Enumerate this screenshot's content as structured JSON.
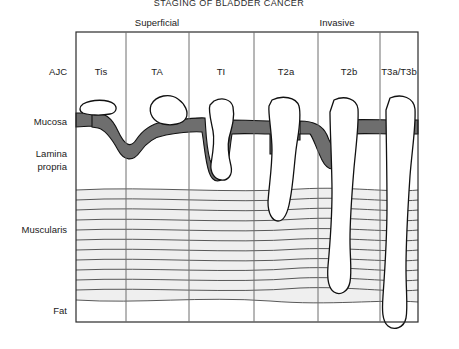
{
  "figure": {
    "title": "STAGING OF BLADDER CANCER",
    "group_labels": [
      {
        "name": "superficial",
        "text": "Superficial"
      },
      {
        "name": "invasive",
        "text": "Invasive"
      }
    ],
    "row_label_header": "AJC",
    "layer_labels": [
      {
        "name": "mucosa",
        "text": "Mucosa"
      },
      {
        "name": "lamina-propria",
        "text": "Lamina"
      },
      {
        "name": "lamina-propria-2",
        "text": "propria"
      },
      {
        "name": "muscularis",
        "text": "Muscularis"
      },
      {
        "name": "fat",
        "text": "Fat"
      }
    ],
    "stages": [
      {
        "id": "tis",
        "label": "Tis",
        "group": "Superficial",
        "depth": "mucosa-flat"
      },
      {
        "id": "ta",
        "label": "TA",
        "group": "Superficial",
        "depth": "papillary-exophytic"
      },
      {
        "id": "t1",
        "label": "TI",
        "group": "Superficial",
        "depth": "lamina-propria"
      },
      {
        "id": "t2a",
        "label": "T2a",
        "group": "Invasive",
        "depth": "superficial-muscle"
      },
      {
        "id": "t2b",
        "label": "T2b",
        "group": "Invasive",
        "depth": "deep-muscle"
      },
      {
        "id": "t3ab",
        "label": "T3a/T3b",
        "group": "Invasive",
        "depth": "perivesical-fat"
      }
    ],
    "colors": {
      "mucosa_fill": "#6e6e6e",
      "tumor_fill": "#ffffff",
      "muscularis_fill": "#efefef",
      "outline": "#111111",
      "frame": "#2b2b2b"
    }
  }
}
